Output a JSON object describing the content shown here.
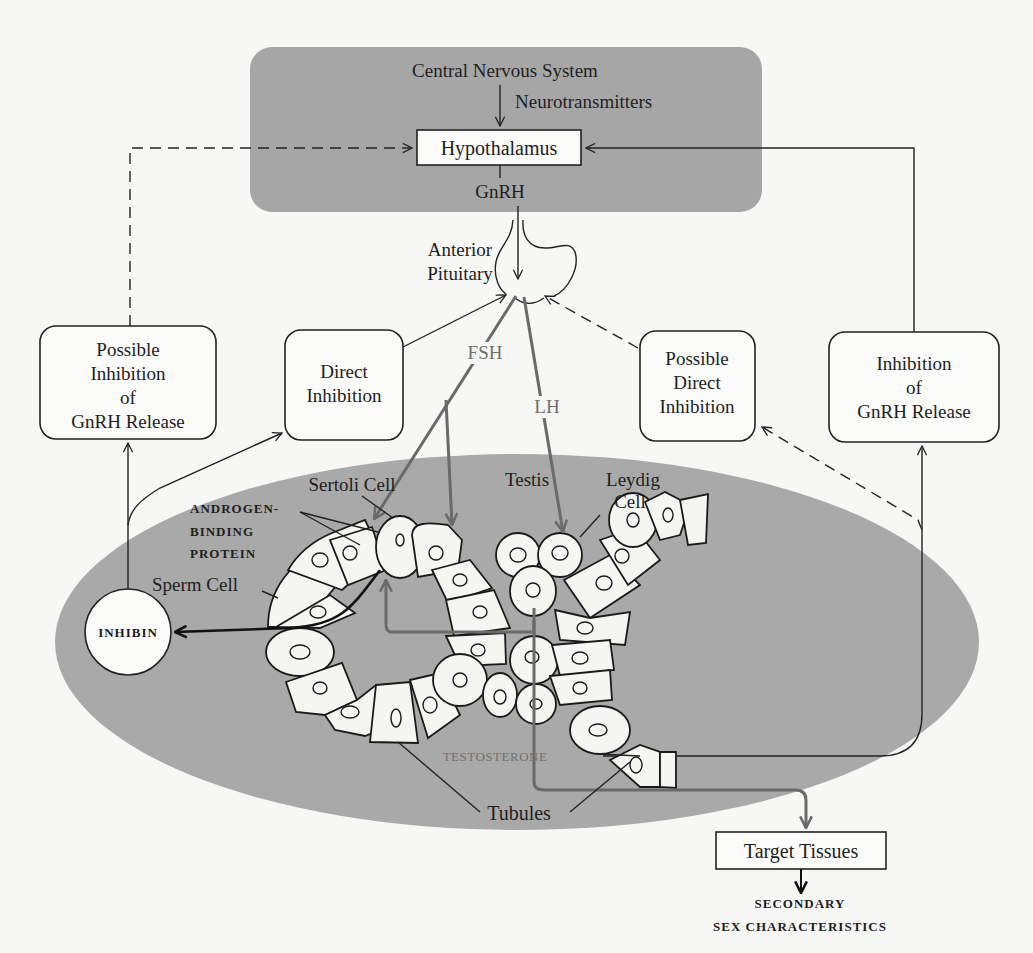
{
  "figure": {
    "colors": {
      "cns_panel": "#a6a6a6",
      "testis_oval": "#a9a9a9",
      "background": "#f7f7f6",
      "hormone_arrow": "#6a6a6a",
      "line": "#222222"
    }
  },
  "cns": {
    "title": "Central Nervous System",
    "neurotransmitters": "Neurotransmitters",
    "hypothalamus": "Hypothalamus",
    "gnrh": "GnRH"
  },
  "pituitary": {
    "label_line1": "Anterior",
    "label_line2": "Pituitary"
  },
  "hormones": {
    "fsh": "FSH",
    "lh": "LH",
    "testosterone": "TESTOSTERONE",
    "inhibin": "INHIBIN"
  },
  "boxes": {
    "possible_inhibition_gnrh": [
      "Possible",
      "Inhibition",
      "of",
      "GnRH Release"
    ],
    "direct_inhibition": [
      "Direct",
      "Inhibition"
    ],
    "possible_direct_inhibition": [
      "Possible",
      "Direct",
      "Inhibition"
    ],
    "inhibition_gnrh": [
      "Inhibition",
      "of",
      "GnRH Release"
    ]
  },
  "testis": {
    "label": "Testis",
    "sertoli_cell": "Sertoli Cell",
    "leydig_line1": "Leydig",
    "leydig_line2": "Cell",
    "abp_line1": "ANDROGEN-",
    "abp_line2": "BINDING",
    "abp_line3": "PROTEIN",
    "sperm_cell": "Sperm Cell",
    "tubules": "Tubules"
  },
  "output": {
    "target_tissues": "Target Tissues",
    "secondary_line1": "SECONDARY",
    "secondary_line2": "SEX CHARACTERISTICS"
  }
}
